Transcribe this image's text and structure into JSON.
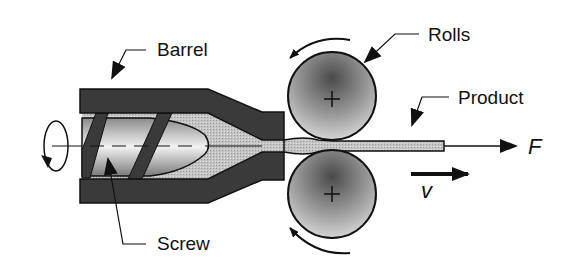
{
  "diagram": {
    "labels": {
      "barrel": "Barrel",
      "rolls": "Rolls",
      "product": "Product",
      "screw": "Screw",
      "force": "F",
      "velocity": "v"
    },
    "components": [
      {
        "id": "barrel",
        "label": "Barrel"
      },
      {
        "id": "screw",
        "label": "Screw"
      },
      {
        "id": "roll-top",
        "label": "Rolls"
      },
      {
        "id": "roll-bottom",
        "label": "Rolls"
      },
      {
        "id": "product",
        "label": "Product"
      }
    ],
    "colors": {
      "barrel": "#3a3a3a",
      "melt": "#bdbdbd",
      "roll_center": "#5a5a5a",
      "roll_edge": "#cfcfcf",
      "outline": "#111111"
    }
  }
}
